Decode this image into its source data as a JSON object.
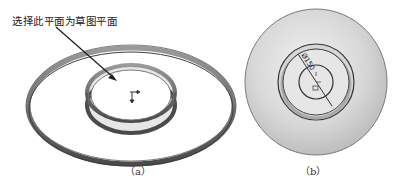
{
  "figure_a": {
    "caption": "（a）",
    "callout_text": "选择此平面为草图平面",
    "elements": [
      "outer-ring",
      "inner-ring",
      "origin-triad",
      "callout-arrow"
    ]
  },
  "figure_b": {
    "caption": "（b）",
    "dimension_text": "Ø150",
    "elements": [
      "outer-disc",
      "inner-ring",
      "sketch-circle",
      "diameter-dimension",
      "origin-marker"
    ]
  },
  "colors": {
    "ring_dark": "#555555",
    "ring_mid": "#8a8a8a",
    "disc_fill": "#cfcfcf",
    "background": "#ffffff"
  }
}
